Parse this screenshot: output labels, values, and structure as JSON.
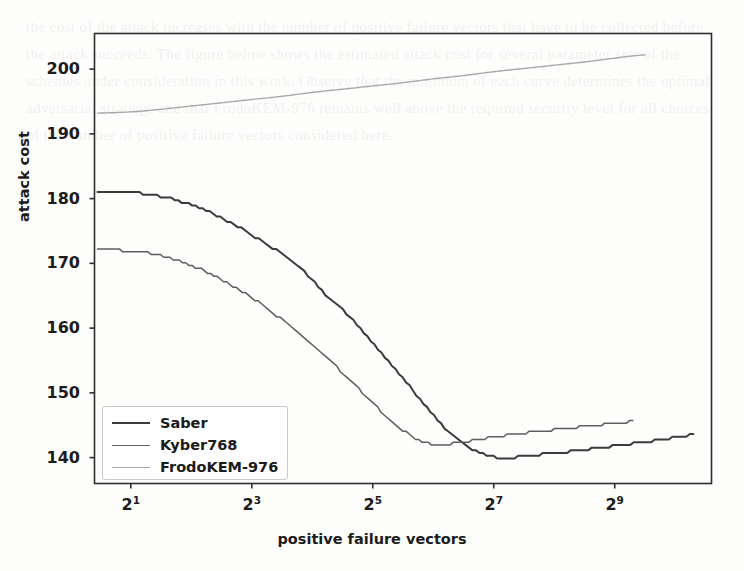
{
  "chart_data": {
    "type": "line",
    "title": "",
    "xlabel": "positive failure vectors",
    "ylabel": "attack cost",
    "xscale": "log2",
    "xlim": [
      0.4,
      10.6
    ],
    "ylim": [
      136.0,
      205.5
    ],
    "grid": false,
    "legend_position": "lower left",
    "xticks": [
      1,
      3,
      5,
      7,
      9
    ],
    "xticklabels": [
      "2¹",
      "2³",
      "2⁵",
      "2⁷",
      "2⁹"
    ],
    "xtick_base": "2",
    "xtick_exponents": [
      "1",
      "3",
      "5",
      "7",
      "9"
    ],
    "yticks": [
      140,
      150,
      160,
      170,
      180,
      190,
      200
    ],
    "yticklabels": [
      "140",
      "150",
      "160",
      "170",
      "180",
      "190",
      "200"
    ],
    "series": [
      {
        "name": "Saber",
        "color": "#3b3b3b",
        "linewidth": 2.0,
        "x": [
          0.45,
          0.8,
          1.1,
          1.4,
          1.7,
          2.0,
          2.3,
          2.6,
          2.9,
          3.2,
          3.5,
          3.8,
          4.0,
          4.2,
          4.4,
          4.6,
          4.8,
          5.0,
          5.2,
          5.4,
          5.6,
          5.8,
          6.0,
          6.2,
          6.4,
          6.6,
          6.8,
          7.0,
          7.2,
          7.5,
          8.0,
          8.5,
          9.0,
          9.5,
          10.0,
          10.3
        ],
        "y": [
          181.0,
          181.0,
          180.9,
          180.5,
          179.9,
          179.0,
          177.9,
          176.5,
          175.0,
          173.2,
          171.4,
          169.3,
          167.4,
          165.4,
          163.8,
          161.9,
          159.9,
          157.8,
          155.6,
          153.4,
          151.1,
          148.8,
          146.6,
          144.5,
          142.8,
          141.5,
          140.6,
          140.1,
          140.0,
          140.2,
          140.7,
          141.2,
          141.8,
          142.4,
          143.1,
          143.5
        ]
      },
      {
        "name": "Kyber768",
        "color": "#5e5e5e",
        "linewidth": 1.5,
        "x": [
          0.45,
          0.8,
          1.1,
          1.4,
          1.7,
          2.0,
          2.3,
          2.6,
          2.9,
          3.2,
          3.5,
          3.8,
          4.0,
          4.2,
          4.4,
          4.6,
          4.8,
          5.0,
          5.2,
          5.4,
          5.6,
          5.8,
          6.0,
          6.2,
          6.4,
          6.6,
          6.8,
          7.0,
          7.5,
          8.0,
          8.5,
          9.0,
          9.3
        ],
        "y": [
          172.0,
          172.0,
          171.8,
          171.4,
          170.7,
          169.7,
          168.5,
          167.0,
          165.3,
          163.4,
          161.3,
          159.0,
          157.4,
          155.7,
          154.0,
          152.2,
          150.3,
          148.4,
          146.6,
          144.9,
          143.6,
          142.6,
          142.1,
          142.1,
          142.3,
          142.6,
          142.9,
          143.2,
          143.8,
          144.3,
          144.8,
          145.3,
          145.6
        ]
      },
      {
        "name": "FrodoKEM-976",
        "color": "#a9a9a9",
        "linewidth": 1.4,
        "x": [
          0.45,
          1.0,
          1.5,
          2.0,
          2.5,
          3.0,
          3.5,
          4.0,
          4.5,
          5.0,
          5.5,
          6.0,
          6.5,
          7.0,
          7.5,
          8.0,
          8.5,
          9.0,
          9.5
        ],
        "y": [
          193.2,
          193.4,
          193.8,
          194.3,
          194.8,
          195.3,
          195.8,
          196.4,
          196.9,
          197.4,
          197.9,
          198.5,
          199.0,
          199.6,
          200.1,
          200.6,
          201.1,
          201.7,
          202.2
        ]
      }
    ]
  },
  "legend": {
    "items": [
      {
        "label": "Saber"
      },
      {
        "label": "Kyber768"
      },
      {
        "label": "FrodoKEM-976"
      }
    ]
  },
  "background_text": "the cost of the attack increases with the number of positive failure vectors that have to be collected before the attack succeeds. The figure below shows the estimated attack cost for several parameter sets of the schemes under consideration in this work. Observe that the minimum of each curve determines the optimal adversarial strategy, and that FrodoKEM-976 remains well above the required security level for all choices of the number of positive failure vectors considered here."
}
